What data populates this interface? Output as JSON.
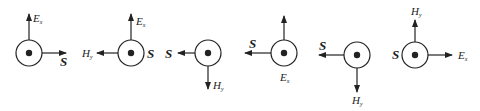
{
  "figure": {
    "colors": {
      "stroke": "#222222",
      "background": "#ffffff"
    },
    "diagrams": [
      {
        "id": 1,
        "center_symbol": "dot-in-circle",
        "up_label": "E",
        "up_sub": "x",
        "right_label": "S"
      },
      {
        "id": 2,
        "center_symbol": "dot-in-circle",
        "up_label": "E",
        "up_sub": "x",
        "left_label": "H",
        "left_sub": "y",
        "side_label": "S"
      },
      {
        "id": 3,
        "center_symbol": "dot-in-circle",
        "left_label": "S",
        "down_label": "H",
        "down_sub": "y"
      },
      {
        "id": 4,
        "center_symbol": "dot-in-circle",
        "left_label": "S",
        "below_label": "E",
        "below_sub": "x"
      },
      {
        "id": 5,
        "center_symbol": "dot-in-circle",
        "left_label": "S",
        "down_label": "H",
        "down_sub": "y"
      },
      {
        "id": 6,
        "center_symbol": "dot-in-circle",
        "up_label": "H",
        "up_sub": "y",
        "side_label": "S",
        "right_label": "E",
        "right_sub": "x"
      }
    ]
  }
}
